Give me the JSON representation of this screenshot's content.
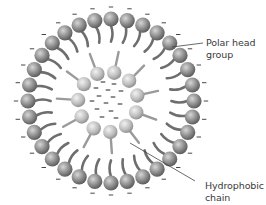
{
  "diagram": {
    "colors": {
      "background": "#ffffff",
      "outer_bead_light": "#d6d6d6",
      "outer_bead_mid": "#8e8e8e",
      "outer_bead_dark": "#555555",
      "inner_bead_light": "#f2f2f2",
      "inner_bead_mid": "#bdbdbd",
      "inner_bead_dark": "#8a8a8a",
      "outer_tail": "#6e6e6e",
      "inner_tail": "#9a9a9a",
      "charge": "#333333",
      "leader_line": "#444444",
      "label_text": "#3a3a3a"
    },
    "outer_ring": {
      "center": [
        111,
        101
      ],
      "rx": 83,
      "ry": 82,
      "bead_count": 32,
      "bead_radius": 7.6,
      "tail_length": 15,
      "charge_offset": 12,
      "charge_symbol": "−"
    },
    "inner_ring": {
      "center": [
        108,
        102
      ],
      "radius": 30,
      "bead_count": 11,
      "bead_radius": 7.2,
      "tail_length": 14,
      "start_angle_deg": -78
    },
    "core_charges": [
      [
        103,
        82
      ],
      [
        114,
        84
      ],
      [
        96,
        88
      ],
      [
        108,
        90
      ],
      [
        121,
        91
      ],
      [
        99,
        96
      ],
      [
        113,
        97
      ],
      [
        92,
        101
      ],
      [
        106,
        103
      ],
      [
        120,
        104
      ],
      [
        97,
        109
      ],
      [
        111,
        111
      ],
      [
        102,
        117
      ],
      [
        116,
        118
      ]
    ],
    "labels": [
      {
        "id": "polar-head-group",
        "lines": [
          "Polar head",
          "group"
        ],
        "text_pos": [
          206,
          37
        ],
        "leader": [
          [
            172,
            47
          ],
          [
            203,
            43
          ]
        ]
      },
      {
        "id": "hydrophobic-chain",
        "lines": [
          "Hydrophobic",
          "chain"
        ],
        "text_pos": [
          205,
          180
        ],
        "leader": [
          [
            130,
            143
          ],
          [
            195,
            181
          ]
        ]
      }
    ]
  }
}
